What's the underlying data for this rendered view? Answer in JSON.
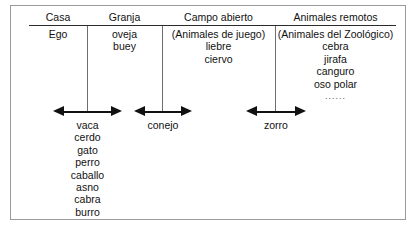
{
  "figure": {
    "columns": [
      {
        "header": "Casa",
        "entries": [
          "Ego"
        ]
      },
      {
        "header": "Granja",
        "entries": [
          "oveja",
          "buey"
        ]
      },
      {
        "header": "Campo abierto",
        "entries": [
          "(Animales de juego)",
          "liebre",
          "ciervo"
        ]
      },
      {
        "header": "Animales remotos",
        "entries": [
          "(Animales del Zoológico)",
          "cebra",
          "jirafa",
          "canguro",
          "oso polar"
        ],
        "ellipsis": "......"
      }
    ],
    "boundaries": [
      {
        "label": "boundary-casa-granja",
        "entries": [
          "vaca",
          "cerdo",
          "gato",
          "perro",
          "caballo",
          "asno",
          "cabra",
          "burro"
        ]
      },
      {
        "label": "boundary-granja-campo",
        "entries": [
          "conejo"
        ]
      },
      {
        "label": "boundary-campo-remotos",
        "entries": [
          "zorro"
        ]
      }
    ]
  }
}
